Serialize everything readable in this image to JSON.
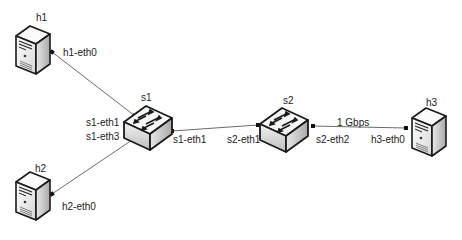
{
  "diagram": {
    "type": "network-topology",
    "nodes": [
      {
        "id": "h1",
        "kind": "host",
        "label": "h1"
      },
      {
        "id": "h2",
        "kind": "host",
        "label": "h2"
      },
      {
        "id": "h3",
        "kind": "host",
        "label": "h3"
      },
      {
        "id": "s1",
        "kind": "switch",
        "label": "s1"
      },
      {
        "id": "s2",
        "kind": "switch",
        "label": "s2"
      }
    ],
    "links": [
      {
        "from": "h1",
        "from_port": "h1-eth0",
        "to": "s1",
        "to_port": "s1-eth1",
        "label": ""
      },
      {
        "from": "h2",
        "from_port": "h2-eth0",
        "to": "s1",
        "to_port": "s1-eth3",
        "label": ""
      },
      {
        "from": "s1",
        "from_port": "s1-eth1",
        "to": "s2",
        "to_port": "s2-eth1",
        "label": ""
      },
      {
        "from": "s2",
        "from_port": "s2-eth2",
        "to": "h3",
        "to_port": "h3-eth0",
        "label": "1 Gbps"
      }
    ]
  },
  "labels": {
    "h1": "h1",
    "h2": "h2",
    "h3": "h3",
    "s1": "s1",
    "s2": "s2",
    "h1_eth0": "h1-eth0",
    "h2_eth0": "h2-eth0",
    "h3_eth0": "h3-eth0",
    "s1_eth1_left": "s1-eth1",
    "s1_eth3": "s1-eth3",
    "s1_eth1_right": "s1-eth1",
    "s2_eth1": "s2-eth1",
    "s2_eth2": "s2-eth2",
    "link_speed": "1 Gbps"
  },
  "colors": {
    "line": "#6b6b6b",
    "port": "#111111",
    "device_outline": "#1a1a1a",
    "device_face": "#f4f4f4",
    "device_side": "#c8c8c8"
  }
}
